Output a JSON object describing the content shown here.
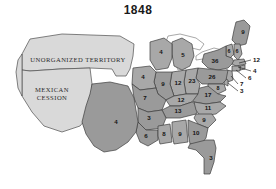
{
  "title": "1848",
  "map": {
    "type": "choropleth-historical-us",
    "year": "1848",
    "value_meaning": "electoral votes per state",
    "territories": [
      {
        "id": "unorganized-territory",
        "label": "UNORGANIZED TERRITORY",
        "fill": "#d9d9d9"
      },
      {
        "id": "mexican-cession",
        "label_line1": "MEXICAN",
        "label_line2": "CESSION",
        "fill": "#d9d9d9"
      }
    ],
    "states": [
      {
        "id": "maine",
        "label": "9",
        "x": 243,
        "y": 18
      },
      {
        "id": "vermont",
        "label": "6",
        "x": 230,
        "y": 40
      },
      {
        "id": "new-hampshire",
        "label": "6",
        "x": 238,
        "y": 42
      },
      {
        "id": "new-york",
        "label": "36",
        "x": 220,
        "y": 48
      },
      {
        "id": "michigan",
        "label": "5",
        "x": 182,
        "y": 42
      },
      {
        "id": "wisconsin",
        "label": "4",
        "x": 159,
        "y": 37
      },
      {
        "id": "iowa",
        "label": "4",
        "x": 143,
        "y": 64
      },
      {
        "id": "illinois",
        "label": "9",
        "x": 161,
        "y": 73
      },
      {
        "id": "indiana",
        "label": "12",
        "x": 177,
        "y": 72
      },
      {
        "id": "ohio",
        "label": "23",
        "x": 193,
        "y": 69
      },
      {
        "id": "pennsylvania",
        "label": "26",
        "x": 213,
        "y": 65
      },
      {
        "id": "maryland",
        "label": "8",
        "x": 222,
        "y": 77
      },
      {
        "id": "virginia",
        "label": "17",
        "x": 209,
        "y": 83
      },
      {
        "id": "missouri",
        "label": "7",
        "x": 146,
        "y": 85
      },
      {
        "id": "kentucky",
        "label": "12",
        "x": 180,
        "y": 88
      },
      {
        "id": "tennessee",
        "label": "13",
        "x": 177,
        "y": 99
      },
      {
        "id": "north-carolina",
        "label": "11",
        "x": 206,
        "y": 96
      },
      {
        "id": "south-carolina",
        "label": "9",
        "x": 203,
        "y": 107
      },
      {
        "id": "arkansas",
        "label": "3",
        "x": 148,
        "y": 105
      },
      {
        "id": "louisiana",
        "label": "6",
        "x": 150,
        "y": 123
      },
      {
        "id": "mississippi",
        "label": "8",
        "x": 164,
        "y": 119
      },
      {
        "id": "alabama",
        "label": "9",
        "x": 180,
        "y": 119
      },
      {
        "id": "georgia",
        "label": "10",
        "x": 196,
        "y": 118
      },
      {
        "id": "florida",
        "label": "3",
        "x": 213,
        "y": 145
      },
      {
        "id": "texas",
        "label": "4",
        "x": 117,
        "y": 124
      }
    ],
    "callouts": [
      {
        "id": "massachusetts",
        "label": "12",
        "tx": 253,
        "ty": 46,
        "x1": 251,
        "y1": 46,
        "x2": 239,
        "y2": 49
      },
      {
        "id": "rhode-island",
        "label": "4",
        "tx": 253,
        "ty": 57,
        "x1": 251,
        "y1": 57,
        "x2": 238,
        "y2": 53
      },
      {
        "id": "connecticut",
        "label": "6",
        "tx": 248,
        "ty": 64,
        "x1": 246,
        "y1": 64,
        "x2": 236,
        "y2": 56
      },
      {
        "id": "new-jersey",
        "label": "7",
        "tx": 240,
        "ty": 70,
        "x1": 238,
        "y1": 70,
        "x2": 230,
        "y2": 62
      },
      {
        "id": "delaware",
        "label": "3",
        "tx": 240,
        "ty": 77,
        "x1": 238,
        "y1": 77,
        "x2": 228,
        "y2": 68
      }
    ]
  }
}
